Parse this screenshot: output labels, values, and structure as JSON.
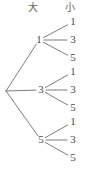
{
  "diagram": {
    "type": "tree-diagram",
    "width": 88,
    "height": 181,
    "background_color": "#ffffff",
    "line_color": "#6e6e6e",
    "text_color": "#4a4a4a",
    "header_color": "#606060"
  },
  "headers": [
    {
      "label": "大",
      "name": "header-large",
      "x": 33,
      "y": 8
    },
    {
      "label": "小",
      "name": "header-small",
      "x": 70,
      "y": 8
    }
  ],
  "root": {
    "x": 6,
    "y": 91,
    "label": ""
  },
  "branches": [
    {
      "label": "1",
      "x": 39,
      "y": 40,
      "leaves": [
        {
          "label": "1",
          "x": 73,
          "y": 22
        },
        {
          "label": "3",
          "x": 73,
          "y": 40
        },
        {
          "label": "5",
          "x": 73,
          "y": 58
        }
      ]
    },
    {
      "label": "3",
      "x": 41,
      "y": 90,
      "leaves": [
        {
          "label": "1",
          "x": 73,
          "y": 72
        },
        {
          "label": "3",
          "x": 73,
          "y": 90
        },
        {
          "label": "5",
          "x": 73,
          "y": 108
        }
      ]
    },
    {
      "label": "5",
      "x": 41,
      "y": 140,
      "leaves": [
        {
          "label": "1",
          "x": 73,
          "y": 122
        },
        {
          "label": "3",
          "x": 73,
          "y": 140
        },
        {
          "label": "5",
          "x": 73,
          "y": 158
        }
      ]
    }
  ]
}
